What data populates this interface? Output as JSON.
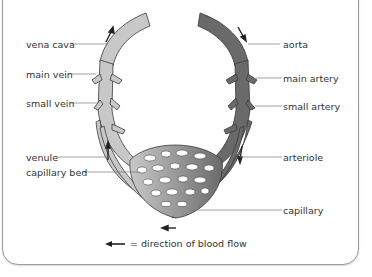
{
  "diagram": {
    "type": "circulation-diagram",
    "left_labels": {
      "vena_cava": "vena cava",
      "main_vein": "main vein",
      "small_vein": "small vein",
      "venule": "venule",
      "capillary_bed": "capillary bed"
    },
    "right_labels": {
      "aorta": "aorta",
      "main_artery": "main artery",
      "small_artery": "small artery",
      "arteriole": "arteriole",
      "capillary": "capillary"
    },
    "legend": {
      "text": "= direction of blood flow",
      "icon": "arrow-left-icon"
    },
    "colors": {
      "vein_fill": "#c8c8c8",
      "artery_fill": "#6a6a6a",
      "outline": "#3a3a3a",
      "leader_line": "#7a7a7a",
      "frame_border": "#9a9a9a"
    }
  }
}
